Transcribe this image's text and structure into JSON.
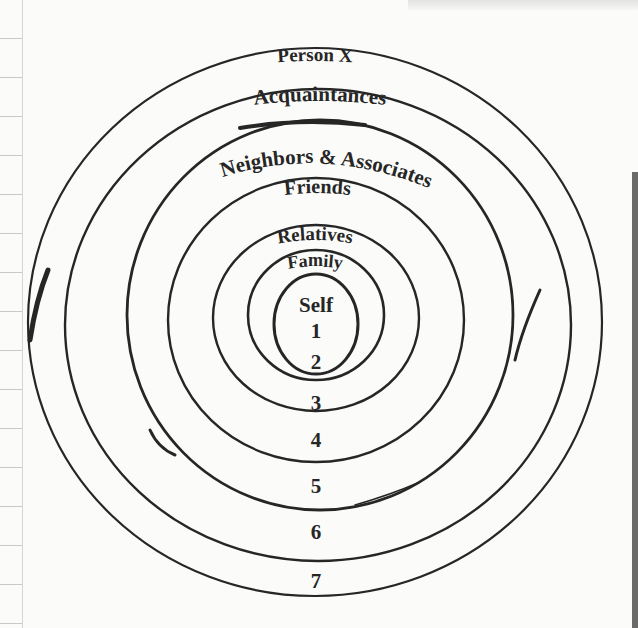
{
  "diagram": {
    "type": "concentric-circles",
    "rings": [
      {
        "label": "Self",
        "number": "1"
      },
      {
        "label": "Family",
        "number": "2"
      },
      {
        "label": "Relatives",
        "number": "3"
      },
      {
        "label": "Friends",
        "number": "4"
      },
      {
        "label": "Neighbors & Associates",
        "number": "5"
      },
      {
        "label": "Acquaintances",
        "number": "6"
      },
      {
        "label": "Person X",
        "number": "7"
      }
    ]
  },
  "colors": {
    "ink": "#262626",
    "paper": "#fbfbf9"
  }
}
